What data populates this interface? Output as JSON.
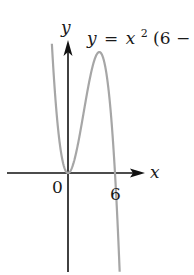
{
  "chart_data": {
    "type": "line",
    "title": "",
    "equation_label": {
      "y": "y",
      "eq": "=",
      "x": "x",
      "exp": "2",
      "rest": "(6 − ",
      "x2": "x",
      "close": ")"
    },
    "xlabel": "x",
    "ylabel": "y",
    "tick_labels": {
      "origin": "0",
      "x_intercept": "6"
    },
    "function": "y = x^2(6 - x)",
    "series": [
      {
        "name": "y = x^2(6 - x)",
        "x": [
          -1.5,
          -1,
          -0.5,
          0,
          1,
          2,
          3,
          4,
          5,
          6,
          6.5
        ],
        "y": [
          30.4,
          7,
          1.6,
          0,
          5,
          16,
          27,
          32,
          25,
          0,
          -21.1
        ]
      }
    ],
    "key_points": [
      {
        "label": "origin / double root",
        "x": 0,
        "y": 0
      },
      {
        "label": "local max",
        "x": 4,
        "y": 32
      },
      {
        "label": "root",
        "x": 6,
        "y": 0
      }
    ],
    "grid": false,
    "legend": "none",
    "colors": {
      "axes": "#111111",
      "curve": "#a6a6a6",
      "text": "#1a1a1a"
    }
  }
}
